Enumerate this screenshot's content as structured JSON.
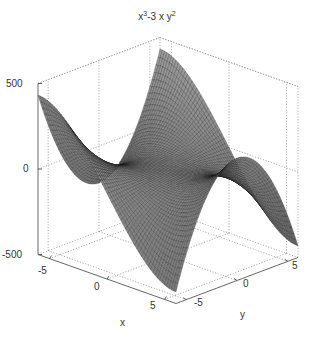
{
  "chart_data": {
    "type": "surface",
    "title_parts": {
      "a": "x",
      "a_exp": "3",
      "b": "-3 x y",
      "b_exp": "2"
    },
    "function": "z = x^3 - 3*x*y^2",
    "xlabel": "x",
    "ylabel": "y",
    "zlabel": "",
    "xlim": [
      -6,
      6
    ],
    "ylim": [
      -6,
      6
    ],
    "zlim": [
      -500,
      500
    ],
    "xticks": [
      "-5",
      "0",
      "5"
    ],
    "yticks": [
      "-5",
      "0",
      "5"
    ],
    "zticks": [
      "500",
      "0",
      "-500"
    ],
    "grid": true,
    "colormap": "gray",
    "mesh_resolution": 60
  }
}
